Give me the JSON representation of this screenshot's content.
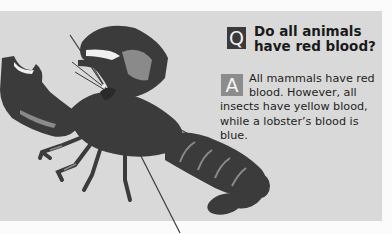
{
  "panel": {
    "background": "#d9d9d9",
    "page_background": "#fbfbfb"
  },
  "illustration": {
    "subject": "lobster",
    "colors": {
      "body": "#3b3b3b",
      "highlight": "#8a8a8a",
      "light": "#f0f0f0"
    }
  },
  "question": {
    "icon_letter": "Q",
    "icon_color": "#3a3a3a",
    "text": "Do all animals have red blood?"
  },
  "answer": {
    "icon_letter": "A",
    "icon_color": "#8c8c8c",
    "text": "All mammals have red blood. However, all insects have yellow blood, while a lobster’s blood is blue."
  }
}
